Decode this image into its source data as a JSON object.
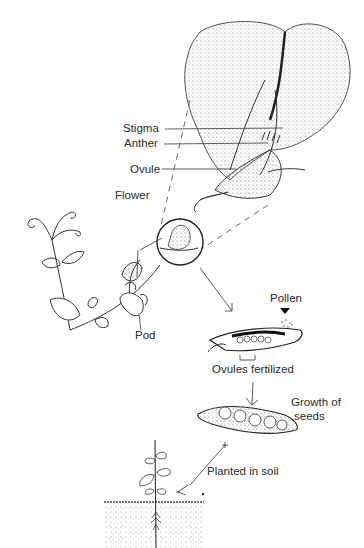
{
  "diagram": {
    "labels": {
      "stigma": "Stigma",
      "anther": "Anther",
      "ovule": "Ovule",
      "flower": "Flower",
      "pod": "Pod",
      "pollen": "Pollen",
      "ovules_fertilized": "Ovules fertilized",
      "growth_of_seeds_line1": "Growth of",
      "growth_of_seeds_line2": "seeds",
      "planted_in_soil": "Planted in soil"
    },
    "stages": [
      "Flower (enlarged cross-section)",
      "Pollen reaches ovules",
      "Ovules fertilized",
      "Growth of seeds",
      "Planted in soil"
    ]
  }
}
